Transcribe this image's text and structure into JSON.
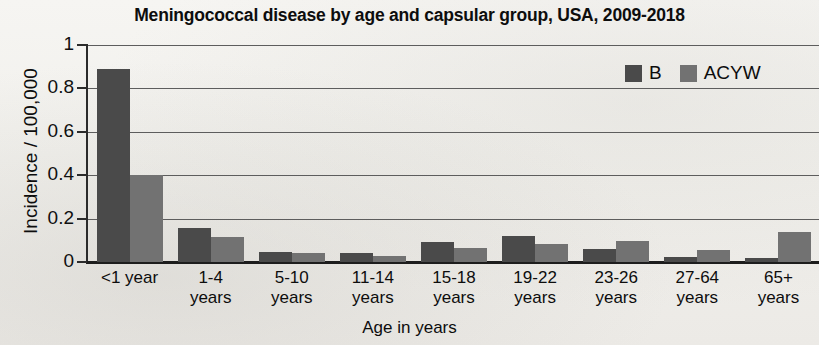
{
  "chart_data": {
    "type": "bar",
    "title": "Meningococcal disease by age and capsular group, USA, 2009-2018",
    "xlabel": "Age in years",
    "ylabel": "Incidence / 100,000",
    "ylim": [
      0,
      1
    ],
    "yticks": [
      "0",
      "0.2",
      "0.4",
      "0.6",
      "0.8",
      "1"
    ],
    "ytick_values": [
      0,
      0.2,
      0.4,
      0.6,
      0.8,
      1
    ],
    "grid": true,
    "legend_position": "top-right",
    "categories": [
      "<1 year",
      "1-4 years",
      "5-10 years",
      "11-14 years",
      "15-18 years",
      "19-22 years",
      "23-26 years",
      "27-64 years",
      "65+ years"
    ],
    "category_lines": [
      [
        "<1 year",
        ""
      ],
      [
        "1-4",
        "years"
      ],
      [
        "5-10",
        "years"
      ],
      [
        "11-14",
        "years"
      ],
      [
        "15-18",
        "years"
      ],
      [
        "19-22",
        "years"
      ],
      [
        "23-26",
        "years"
      ],
      [
        "27-64",
        "years"
      ],
      [
        "65+",
        "years"
      ]
    ],
    "series": [
      {
        "name": "B",
        "color": "#4a4a4a",
        "values": [
          0.89,
          0.155,
          0.045,
          0.04,
          0.09,
          0.12,
          0.06,
          0.025,
          0.02
        ]
      },
      {
        "name": "ACYW",
        "color": "#727272",
        "values": [
          0.4,
          0.115,
          0.04,
          0.028,
          0.065,
          0.085,
          0.095,
          0.055,
          0.14
        ]
      }
    ]
  }
}
